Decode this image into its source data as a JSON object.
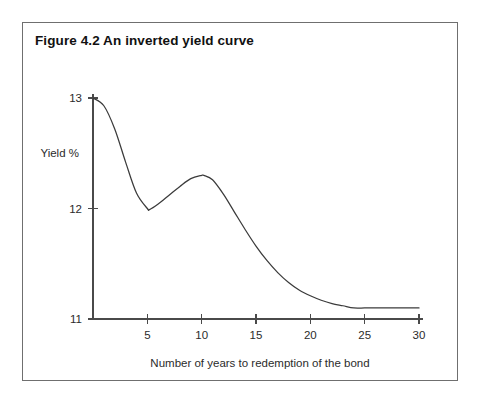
{
  "figure": {
    "title": "Figure 4.2 An inverted yield curve",
    "border_color": "#6f6f6f",
    "background": "#ffffff"
  },
  "chart_data": {
    "type": "line",
    "title": "Figure 4.2 An inverted yield curve",
    "xlabel": "Number of years to redemption of the bond",
    "ylabel": "Yield %",
    "xlim": [
      0,
      30
    ],
    "ylim": [
      11,
      13
    ],
    "xticks": [
      5,
      10,
      15,
      20,
      25,
      30
    ],
    "xtick_labels": [
      "5",
      "10",
      "15",
      "20",
      "25",
      "30"
    ],
    "yticks": [
      11,
      12,
      13
    ],
    "ytick_labels": [
      "11",
      "12",
      "13"
    ],
    "grid": false,
    "legend": null,
    "series": [
      {
        "name": "Inverted yield curve",
        "color": "#3b3b3b",
        "x": [
          0,
          1,
          2,
          3,
          4,
          5,
          5.2,
          6,
          7,
          8,
          9,
          10,
          10.2,
          11,
          12,
          13,
          14,
          15,
          16,
          17,
          18,
          19,
          20,
          21,
          22,
          23,
          24,
          25,
          26,
          27,
          28,
          29,
          30
        ],
        "y": [
          13.0,
          12.93,
          12.72,
          12.42,
          12.14,
          12.0,
          11.99,
          12.04,
          12.12,
          12.2,
          12.27,
          12.3,
          12.3,
          12.26,
          12.13,
          11.97,
          11.81,
          11.66,
          11.53,
          11.42,
          11.33,
          11.26,
          11.21,
          11.17,
          11.14,
          11.12,
          11.1,
          11.1,
          11.1,
          11.1,
          11.1,
          11.1,
          11.1
        ]
      }
    ],
    "annotations": []
  }
}
